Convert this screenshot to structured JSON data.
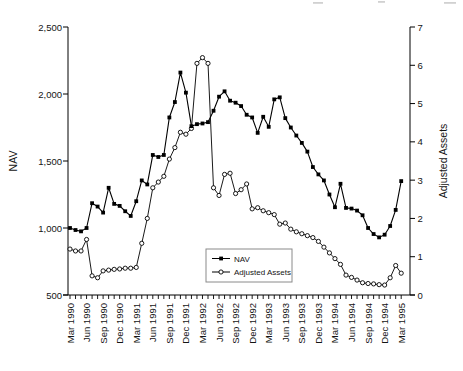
{
  "page": {
    "background": "#ffffff",
    "top_cropped_text_artifact": true
  },
  "chart_data": {
    "type": "line",
    "title": "",
    "n_points": 61,
    "x_start": "Mar 1990",
    "x_end": "Mar 1995",
    "x_frequency": "monthly",
    "points_per_x_label": 3,
    "x_tick_labels": [
      "Mar 1990",
      "Jun 1990",
      "Sep 1990",
      "Dec 1990",
      "Mar 1991",
      "Jun 1991",
      "Sep 1991",
      "Dec 1991",
      "Mar 1992",
      "Jun 1992",
      "Sep 1992",
      "Dec 1992",
      "Mar 1993",
      "Jun 1993",
      "Sep 1993",
      "Dec 1993",
      "Mar 1994",
      "Jun 1994",
      "Sep 1994",
      "Dec 1994",
      "Mar 1995"
    ],
    "left_axis": {
      "title": "NAV",
      "min": 500,
      "max": 2500,
      "tick_step": 500,
      "tick_labels": [
        "500",
        "1,000",
        "1,500",
        "2,000",
        "2,500"
      ]
    },
    "right_axis": {
      "title": "Adjusted Assets",
      "min": 0,
      "max": 7,
      "tick_step": 1,
      "tick_labels": [
        "0",
        "1",
        "2",
        "3",
        "4",
        "5",
        "6",
        "7"
      ]
    },
    "grid": false,
    "line_color": "#000000",
    "legend": {
      "position": "inside-lower-middle",
      "border_color": "#8a8a8a",
      "entries": [
        {
          "label": "NAV",
          "marker": "filled-square"
        },
        {
          "label": "Adjusted Assets",
          "marker": "open-circle"
        }
      ]
    },
    "series": [
      {
        "name": "NAV",
        "axis": "left",
        "marker": "filled-square",
        "values": [
          1000,
          985,
          975,
          1000,
          1185,
          1160,
          1115,
          1300,
          1180,
          1165,
          1125,
          1090,
          1200,
          1355,
          1325,
          1545,
          1530,
          1545,
          1825,
          1940,
          2160,
          2010,
          1760,
          1775,
          1780,
          1790,
          1875,
          1980,
          2020,
          1950,
          1935,
          1910,
          1845,
          1825,
          1710,
          1830,
          1755,
          1960,
          1975,
          1820,
          1750,
          1690,
          1635,
          1570,
          1455,
          1400,
          1355,
          1250,
          1155,
          1330,
          1150,
          1145,
          1130,
          1095,
          1000,
          955,
          930,
          950,
          1015,
          1135,
          1350
        ]
      },
      {
        "name": "Adjusted Assets",
        "axis": "right",
        "marker": "open-circle",
        "values": [
          1.2,
          1.15,
          1.15,
          1.45,
          0.5,
          0.45,
          0.63,
          0.65,
          0.67,
          0.68,
          0.7,
          0.7,
          0.72,
          1.35,
          2.0,
          2.8,
          2.95,
          3.1,
          3.55,
          3.85,
          4.25,
          4.2,
          4.35,
          6.05,
          6.2,
          6.05,
          2.8,
          2.6,
          3.15,
          3.18,
          2.65,
          2.75,
          2.9,
          2.25,
          2.28,
          2.2,
          2.15,
          2.1,
          1.85,
          1.88,
          1.72,
          1.65,
          1.6,
          1.55,
          1.5,
          1.4,
          1.25,
          1.1,
          0.95,
          0.8,
          0.52,
          0.46,
          0.39,
          0.32,
          0.3,
          0.29,
          0.27,
          0.26,
          0.45,
          0.77,
          0.57
        ]
      }
    ]
  }
}
